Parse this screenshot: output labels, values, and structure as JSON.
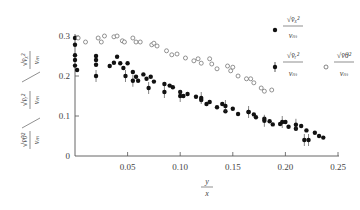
{
  "chart_data": {
    "type": "scatter",
    "title": "",
    "xlabel": "y/x",
    "ylabel": "sqrt(v_x'^2)/v_m / sqrt(v_r'^2)/v_m / sqrt(v_θ'^2)/v_m",
    "xlim": [
      0,
      0.25
    ],
    "ylim": [
      0,
      0.3
    ],
    "x_ticks": [
      "0.05",
      "0.10",
      "0.15",
      "0.20",
      "0.25"
    ],
    "y_ticks": [
      "0",
      "0.1",
      "0.2",
      "0.3"
    ],
    "grid": false,
    "legend_position": "right",
    "series": [
      {
        "name": "sqrt(v_x'^2)/v_m",
        "marker": "filled-circle",
        "points": [
          [
            0.0,
            0.295
          ],
          [
            0.0,
            0.278
          ],
          [
            0.0,
            0.252
          ],
          [
            0.0,
            0.24
          ],
          [
            0.0,
            0.226
          ],
          [
            0.002,
            0.215
          ],
          [
            0.02,
            0.25
          ],
          [
            0.02,
            0.24
          ],
          [
            0.02,
            0.228
          ],
          [
            0.033,
            0.225
          ],
          [
            0.037,
            0.233
          ],
          [
            0.04,
            0.248
          ],
          [
            0.043,
            0.232
          ],
          [
            0.046,
            0.22
          ],
          [
            0.05,
            0.232
          ],
          [
            0.055,
            0.21
          ],
          [
            0.058,
            0.198
          ],
          [
            0.06,
            0.188
          ],
          [
            0.065,
            0.204
          ],
          [
            0.068,
            0.193
          ],
          [
            0.072,
            0.198
          ],
          [
            0.075,
            0.186
          ],
          [
            0.085,
            0.18
          ],
          [
            0.09,
            0.176
          ],
          [
            0.093,
            0.172
          ],
          [
            0.1,
            0.16
          ],
          [
            0.103,
            0.15
          ],
          [
            0.107,
            0.155
          ],
          [
            0.115,
            0.148
          ],
          [
            0.12,
            0.14
          ],
          [
            0.125,
            0.13
          ],
          [
            0.128,
            0.135
          ],
          [
            0.135,
            0.122
          ],
          [
            0.14,
            0.13
          ],
          [
            0.143,
            0.112
          ],
          [
            0.15,
            0.118
          ],
          [
            0.155,
            0.105
          ],
          [
            0.165,
            0.11
          ],
          [
            0.17,
            0.104
          ],
          [
            0.172,
            0.097
          ],
          [
            0.18,
            0.093
          ],
          [
            0.185,
            0.087
          ],
          [
            0.188,
            0.079
          ],
          [
            0.195,
            0.08
          ],
          [
            0.2,
            0.085
          ],
          [
            0.203,
            0.073
          ],
          [
            0.21,
            0.068
          ],
          [
            0.215,
            0.075
          ],
          [
            0.22,
            0.064
          ],
          [
            0.228,
            0.058
          ],
          [
            0.232,
            0.05
          ],
          [
            0.236,
            0.046
          ]
        ]
      },
      {
        "name": "sqrt(v_r'^2)/v_m",
        "marker": "filled-circle-with-error-bar",
        "points": [
          [
            0.02,
            0.2
          ],
          [
            0.048,
            0.2
          ],
          [
            0.055,
            0.188
          ],
          [
            0.07,
            0.17
          ],
          [
            0.085,
            0.16
          ],
          [
            0.1,
            0.15
          ],
          [
            0.12,
            0.145
          ],
          [
            0.143,
            0.125
          ],
          [
            0.165,
            0.11
          ],
          [
            0.18,
            0.088
          ],
          [
            0.197,
            0.085
          ],
          [
            0.21,
            0.078
          ],
          [
            0.218,
            0.04
          ],
          [
            0.222,
            0.04
          ]
        ]
      },
      {
        "name": "sqrt(v_θ'^2)/v_m",
        "marker": "open-circle",
        "points": [
          [
            0.003,
            0.295
          ],
          [
            0.01,
            0.285
          ],
          [
            0.022,
            0.295
          ],
          [
            0.025,
            0.285
          ],
          [
            0.028,
            0.3
          ],
          [
            0.037,
            0.298
          ],
          [
            0.04,
            0.3
          ],
          [
            0.045,
            0.288
          ],
          [
            0.047,
            0.285
          ],
          [
            0.055,
            0.295
          ],
          [
            0.058,
            0.285
          ],
          [
            0.062,
            0.285
          ],
          [
            0.073,
            0.278
          ],
          [
            0.075,
            0.282
          ],
          [
            0.078,
            0.275
          ],
          [
            0.087,
            0.263
          ],
          [
            0.092,
            0.253
          ],
          [
            0.097,
            0.255
          ],
          [
            0.105,
            0.245
          ],
          [
            0.113,
            0.238
          ],
          [
            0.117,
            0.243
          ],
          [
            0.12,
            0.232
          ],
          [
            0.128,
            0.243
          ],
          [
            0.13,
            0.23
          ],
          [
            0.135,
            0.218
          ],
          [
            0.145,
            0.225
          ],
          [
            0.148,
            0.213
          ],
          [
            0.15,
            0.222
          ],
          [
            0.155,
            0.2
          ],
          [
            0.163,
            0.193
          ],
          [
            0.167,
            0.193
          ],
          [
            0.17,
            0.183
          ],
          [
            0.177,
            0.17
          ],
          [
            0.18,
            0.162
          ],
          [
            0.187,
            0.165
          ]
        ]
      }
    ]
  },
  "axes": {
    "x_label_top": "y",
    "x_label_bottom": "x",
    "y_tick_labels": [
      "0",
      "0.1",
      "0.2",
      "0.3"
    ],
    "x_tick_labels": [
      "0.05",
      "0.10",
      "0.15",
      "0.20",
      "0.25"
    ]
  },
  "legend": {
    "items": [
      {
        "numerator": "√v̄ₓ²",
        "denominator": "vₘ"
      },
      {
        "numerator": "√v̄ᵣ²",
        "denominator": "vₘ"
      },
      {
        "numerator": "√v̄θ²",
        "denominator": "vₘ"
      }
    ]
  },
  "ylabel_parts": [
    {
      "numerator": "√v̄θ²",
      "denominator": "vₘ"
    },
    {
      "numerator": "√v̄ᵣ²",
      "denominator": "vₘ"
    },
    {
      "numerator": "√v̄ₓ²",
      "denominator": "vₘ"
    }
  ]
}
